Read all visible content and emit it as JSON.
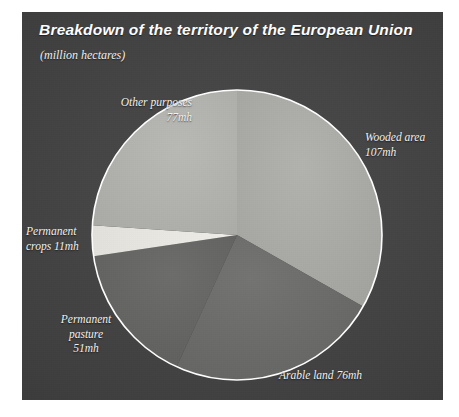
{
  "panel": {
    "title": "Breakdown of the territory of the European Union",
    "subtitle": "(million hectares)",
    "background_color": "#3e3e3e",
    "title_color": "#ffffff"
  },
  "chart_data": {
    "type": "pie",
    "title": "Breakdown of the territory of the European Union",
    "subtitle": "(million hectares)",
    "unit": "million hectares",
    "unit_abbreviation": "mh",
    "total": 322,
    "legend": "none",
    "labels_inline": true,
    "categories": [
      "Wooded area",
      "Arable land",
      "Permanent pasture",
      "Permanent crops",
      "Other purposes"
    ],
    "values": [
      107,
      76,
      51,
      11,
      77
    ],
    "slices": [
      {
        "name": "Wooded area",
        "value": 107,
        "value_label": "107mh",
        "label_text": "Wooded area\n107mh",
        "percent": 33.2,
        "color": "#a9a9a6",
        "start_angle_deg": -90,
        "end_angle_deg": 29.6
      },
      {
        "name": "Arable land",
        "value": 76,
        "value_label": "76mh",
        "label_text": "Arable land 76mh",
        "percent": 23.6,
        "color": "#6b6b69",
        "start_angle_deg": 29.6,
        "end_angle_deg": 114.6
      },
      {
        "name": "Permanent pasture",
        "value": 51,
        "value_label": "51mh",
        "label_text": "Permanent\npasture\n51mh",
        "percent": 15.8,
        "color": "#646462",
        "start_angle_deg": 114.6,
        "end_angle_deg": 171.6
      },
      {
        "name": "Permanent crops",
        "value": 11,
        "value_label": "11mh",
        "label_text": "Permanent\ncrops 11mh",
        "percent": 3.4,
        "color": "#e9e8e2",
        "start_angle_deg": 171.6,
        "end_angle_deg": 183.9
      },
      {
        "name": "Other purposes",
        "value": 77,
        "value_label": "77mh",
        "label_text": "Other purposes\n77mh",
        "percent": 23.9,
        "color": "#b1b1ad",
        "start_angle_deg": 183.9,
        "end_angle_deg": 270
      }
    ],
    "geometry": {
      "center_x": 215,
      "center_y": 223,
      "radius": 145,
      "outline_color": "#ffffff",
      "outline_width": 1.6
    }
  }
}
